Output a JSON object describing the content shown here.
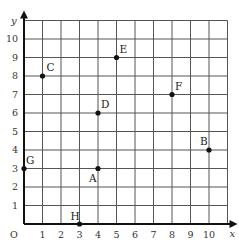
{
  "diagram": {
    "type": "coordinate-grid",
    "origin_label": "O",
    "x_axis": {
      "label": "x",
      "ticks": [
        "1",
        "2",
        "3",
        "4",
        "5",
        "6",
        "7",
        "8",
        "9",
        "10"
      ],
      "range": [
        0,
        11
      ]
    },
    "y_axis": {
      "label": "y",
      "ticks": [
        "1",
        "2",
        "3",
        "4",
        "5",
        "6",
        "7",
        "8",
        "9",
        "10"
      ],
      "range": [
        0,
        11
      ]
    },
    "points": [
      {
        "label": "A",
        "x": 4,
        "y": 3
      },
      {
        "label": "B",
        "x": 10,
        "y": 4
      },
      {
        "label": "C",
        "x": 1,
        "y": 8
      },
      {
        "label": "D",
        "x": 4,
        "y": 6
      },
      {
        "label": "E",
        "x": 5,
        "y": 9
      },
      {
        "label": "F",
        "x": 8,
        "y": 7
      },
      {
        "label": "G",
        "x": 0,
        "y": 3
      },
      {
        "label": "H",
        "x": 3,
        "y": 0
      }
    ],
    "colors": {
      "grid": "#555555",
      "axis": "#111111",
      "point": "#111111"
    }
  }
}
